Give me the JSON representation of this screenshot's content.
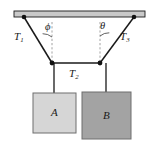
{
  "figure": {
    "background_color": "#ffffff",
    "width": 156,
    "height": 147
  },
  "ceiling": {
    "name": "ceiling-bar",
    "fill_color": "#c9c9c9",
    "stroke_color": "#1a1a1a",
    "x": 14,
    "y": 11,
    "width": 131,
    "height": 6
  },
  "anchors": [
    {
      "name": "left-anchor-point",
      "x": 24,
      "y": 17
    },
    {
      "name": "right-anchor-point",
      "x": 134,
      "y": 17
    }
  ],
  "junctions": [
    {
      "name": "left-junction-point",
      "x": 52,
      "y": 63
    },
    {
      "name": "right-junction-point",
      "x": 100,
      "y": 63
    }
  ],
  "cords": [
    {
      "name": "cord-T1",
      "label": "T",
      "subscript": "1",
      "from": "left-anchor",
      "to": "left-junction"
    },
    {
      "name": "cord-T2",
      "label": "T",
      "subscript": "2",
      "from": "left-junction",
      "to": "right-junction"
    },
    {
      "name": "cord-T3",
      "label": "T",
      "subscript": "3",
      "from": "right-anchor",
      "to": "right-junction"
    },
    {
      "name": "cord-block-a",
      "from": "left-junction",
      "to": "block-a"
    },
    {
      "name": "cord-block-b",
      "from": "right-junction",
      "to": "block-b"
    }
  ],
  "labels": {
    "T1": {
      "base": "T",
      "sub": "1"
    },
    "T2": {
      "base": "T",
      "sub": "2"
    },
    "T3": {
      "base": "T",
      "sub": "3"
    },
    "phi": "ϕ",
    "theta": "θ",
    "block_a": "A",
    "block_b": "B"
  },
  "angles": [
    {
      "name": "angle-phi",
      "symbol": "ϕ",
      "vertex": "left-junction",
      "between": [
        "vertical-dashed-line-left",
        "cord-T1"
      ]
    },
    {
      "name": "angle-theta",
      "symbol": "θ",
      "vertex": "right-junction",
      "between": [
        "vertical-dashed-line-right",
        "cord-T3"
      ]
    }
  ],
  "dashed_lines": [
    {
      "name": "vertical-dashed-line-left",
      "x": 52,
      "y1": 22,
      "y2": 63
    },
    {
      "name": "vertical-dashed-line-right",
      "x": 100,
      "y1": 22,
      "y2": 63
    }
  ],
  "blocks": [
    {
      "name": "block-a",
      "label": "A",
      "fill_color": "#d6d6d6",
      "stroke_color": "#6e6e6e",
      "x": 33,
      "y": 93,
      "width": 43,
      "height": 40
    },
    {
      "name": "block-b",
      "label": "B",
      "fill_color": "#a3a3a3",
      "stroke_color": "#6e6e6e",
      "x": 82,
      "y": 92,
      "width": 49,
      "height": 47
    }
  ],
  "colors": {
    "line": "#1a1a1a",
    "ceiling_fill": "#c9c9c9",
    "block_a_fill": "#d6d6d6",
    "block_b_fill": "#a3a3a3",
    "dashed": "#8c8c8c"
  }
}
